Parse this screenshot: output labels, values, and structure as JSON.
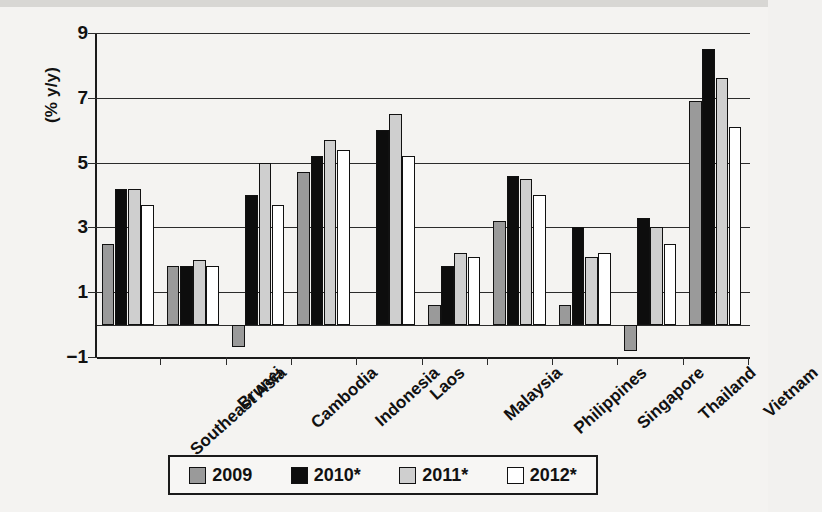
{
  "chart_data": {
    "type": "bar",
    "title": "",
    "xlabel": "",
    "ylabel": "(% y/y)",
    "ylim": [
      -1,
      9
    ],
    "yticks": [
      -1,
      1,
      3,
      5,
      7,
      9
    ],
    "ytick_labels": [
      "−1",
      "1",
      "3",
      "5",
      "7",
      "9"
    ],
    "grid": true,
    "legend_position": "bottom",
    "categories": [
      "Southeast Asia",
      "Brunei",
      "Cambodia",
      "Indonesia",
      "Laos",
      "Malaysia",
      "Philippines",
      "Singapore",
      "Thailand",
      "Vietnam"
    ],
    "series": [
      {
        "name": "2009",
        "color": "#9a9a9a",
        "values": [
          2.5,
          1.8,
          -0.7,
          4.7,
          null,
          0.6,
          3.2,
          0.6,
          -0.8,
          6.9
        ]
      },
      {
        "name": "2010*",
        "color": "#0d0d0d",
        "values": [
          4.2,
          1.8,
          4.0,
          5.2,
          6.0,
          1.8,
          4.6,
          3.0,
          3.3,
          8.5
        ]
      },
      {
        "name": "2011*",
        "color": "#cfcfcf",
        "values": [
          4.2,
          2.0,
          5.0,
          5.7,
          6.5,
          2.2,
          4.5,
          2.1,
          3.0,
          7.6
        ]
      },
      {
        "name": "2012*",
        "color": "#ffffff",
        "values": [
          3.7,
          1.8,
          3.7,
          5.4,
          5.2,
          2.1,
          4.0,
          2.2,
          2.5,
          6.1
        ]
      }
    ]
  },
  "legend": {
    "items": [
      {
        "label": "2009",
        "color": "#9a9a9a"
      },
      {
        "label": "2010*",
        "color": "#0d0d0d"
      },
      {
        "label": "2011*",
        "color": "#cfcfcf"
      },
      {
        "label": "2012*",
        "color": "#ffffff"
      }
    ]
  }
}
